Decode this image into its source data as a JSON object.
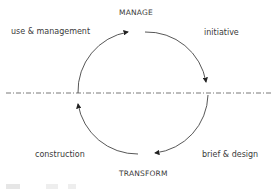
{
  "diagram": {
    "top_label": "MANAGE",
    "bottom_label": "TRANSFORM",
    "stages": [
      {
        "label": "use & management",
        "position": "top-left"
      },
      {
        "label": "initiative",
        "position": "top-right"
      },
      {
        "label": "brief & design",
        "position": "bottom-right"
      },
      {
        "label": "construction",
        "position": "bottom-left"
      }
    ],
    "cycle_direction": "clockwise",
    "divider": "dash-dot horizontal line"
  }
}
